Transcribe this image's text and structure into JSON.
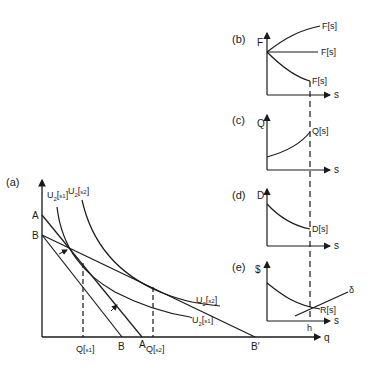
{
  "figure": {
    "background": "#ffffff",
    "ink_color": "#1a1a1a"
  },
  "panel_a": {
    "label": "(a)",
    "x_axis_label": "q",
    "y_axis_points": {
      "A": "A",
      "B": "B"
    },
    "x_axis_points": {
      "B": "B",
      "A": "A",
      "B_prime": "B′"
    },
    "quantities": {
      "q1_main": "Q",
      "q1_sub": "s1",
      "q2_main": "Q",
      "q2_sub": "s2"
    },
    "curves": {
      "u_s1": {
        "main": "U",
        "num": "2",
        "sub": "s1"
      },
      "u_s2": {
        "main": "U",
        "num": "2",
        "sub": "s2"
      }
    }
  },
  "panel_b": {
    "label": "(b)",
    "y_axis_label": "F",
    "x_axis_label": "s",
    "curve_labels": [
      "F[s]",
      "F[s]",
      "F[s]"
    ]
  },
  "panel_c": {
    "label": "(c)",
    "y_axis_label": "Q",
    "x_axis_label": "s",
    "curve_label": "Q[s]"
  },
  "panel_d": {
    "label": "(d)",
    "y_axis_label": "D",
    "x_axis_label": "s",
    "curve_label": "D[s]"
  },
  "panel_e": {
    "label": "(e)",
    "y_axis_label": "$",
    "x_axis_label": "s",
    "curve_label": "R[s]",
    "line_label": "δ",
    "tick_label": "h"
  }
}
